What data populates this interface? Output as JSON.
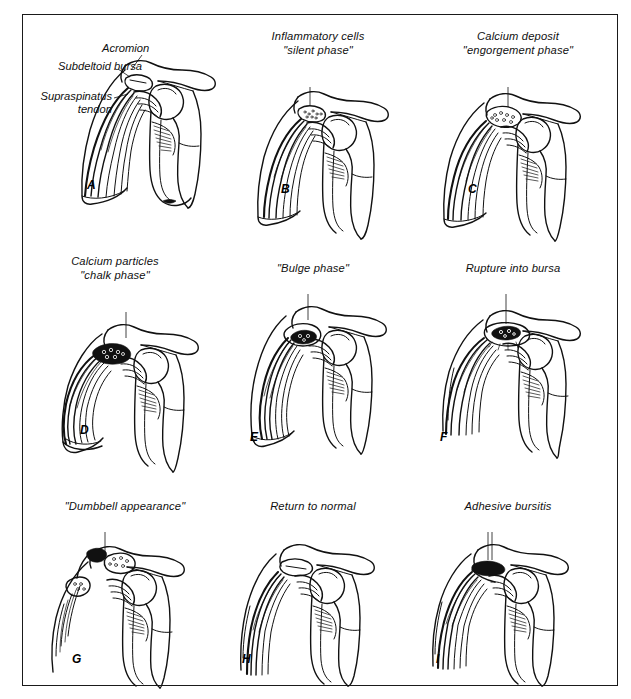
{
  "figure": {
    "background_color": "#ffffff",
    "border_color": "#1a1a1a",
    "ink_color": "#111111",
    "title": ""
  },
  "labels": {
    "acromion": "Acromion",
    "subdeltoid_bursa": "Subdeltoid bursa",
    "supraspinatus_tendon_line1": "Supraspinatus",
    "supraspinatus_tendon_line2": "tendon"
  },
  "panels": [
    {
      "letter": "A",
      "caption_lines": [],
      "has_anatomy_labels": true
    },
    {
      "letter": "B",
      "caption_lines": [
        "Inflammatory cells",
        "\"silent phase\""
      ],
      "has_anatomy_labels": false
    },
    {
      "letter": "C",
      "caption_lines": [
        "Calcium deposit",
        "\"engorgement phase\""
      ],
      "has_anatomy_labels": false
    },
    {
      "letter": "D",
      "caption_lines": [
        "Calcium particles",
        "\"chalk phase\""
      ],
      "has_anatomy_labels": false
    },
    {
      "letter": "E",
      "caption_lines": [
        "\"Bulge phase\""
      ],
      "has_anatomy_labels": false
    },
    {
      "letter": "F",
      "caption_lines": [
        "Rupture into bursa"
      ],
      "has_anatomy_labels": false
    },
    {
      "letter": "G",
      "caption_lines": [
        "\"Dumbbell appearance\""
      ],
      "has_anatomy_labels": false
    },
    {
      "letter": "H",
      "caption_lines": [
        "Return to normal"
      ],
      "has_anatomy_labels": false
    },
    {
      "letter": "I",
      "caption_lines": [
        "Adhesive bursitis"
      ],
      "has_anatomy_labels": false
    }
  ]
}
